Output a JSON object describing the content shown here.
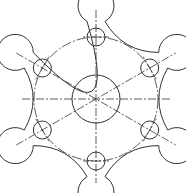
{
  "drawing": {
    "title": "Flange plate with six bolt holes (technical drawing)",
    "center": [
      96,
      99
    ],
    "central_circle_radius": 24,
    "bolt_circle_radius": 62,
    "hole_radius": 9,
    "boss_radius": 18,
    "hole_angles_deg": [
      90,
      30,
      -30,
      -90,
      -150,
      150
    ],
    "line_color": "#333333",
    "background": "#ffffff"
  }
}
